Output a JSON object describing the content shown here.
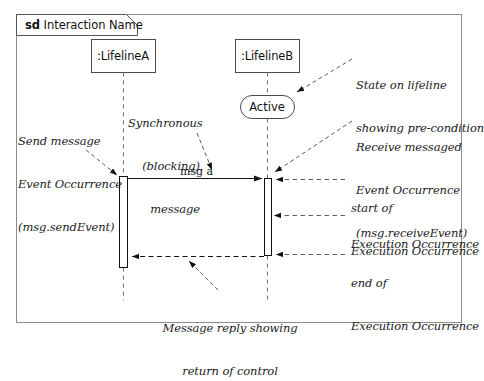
{
  "frame": {
    "keyword": "sd",
    "name": "Interaction Name"
  },
  "lifelines": [
    {
      "id": "a",
      "label": ":LifelineA"
    },
    {
      "id": "b",
      "label": ":LifelineB"
    }
  ],
  "state": {
    "label": "Active"
  },
  "messages": [
    {
      "id": "msg-a",
      "label": "msg a",
      "kind": "synchronous"
    },
    {
      "id": "reply",
      "label": "",
      "kind": "reply"
    }
  ],
  "annotations": {
    "send_event": {
      "line1": "Send message",
      "line2": "Event Occurrence",
      "line3": "(msg.sendEvent)"
    },
    "synchronous": {
      "line1": "Synchronous",
      "line2": "(blocking)",
      "line3": "message"
    },
    "state_note": {
      "line1": "State on lifeline",
      "line2": "showing pre-condition"
    },
    "receive_event": {
      "line1": "Receive messaged",
      "line2": "Event Occurrence",
      "line3": "(msg.receiveEvent)"
    },
    "start_exec": {
      "line1": "start of",
      "line2": "Execution Occurrence"
    },
    "exec": {
      "line1": "Execution Occurrence"
    },
    "end_exec": {
      "line1": "end of",
      "line2": "Execution Occurrence"
    },
    "reply_note": {
      "line1": "Message reply showing",
      "line2": "return of control"
    }
  },
  "colors": {
    "frame_border": "#8c8c8c",
    "shape_border": "#4a4a4a",
    "line": "#111111",
    "text": "#1b1b1b",
    "background": "#ffffff"
  }
}
